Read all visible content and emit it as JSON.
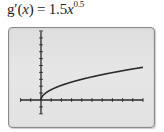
{
  "formula": {
    "lhs": "g′(",
    "var": "x",
    "mid": ") = 1.5",
    "base": "x",
    "exponent": "0.5"
  },
  "chart_data": {
    "type": "line",
    "xlabel": "",
    "ylabel": "",
    "xlim": [
      -2,
      10
    ],
    "ylim": [
      -2,
      10
    ],
    "x_tick_step": 1,
    "y_tick_step": 1,
    "grid": false,
    "legend": null,
    "series": [
      {
        "name": "g'(x) = 1.5x^0.5",
        "x": [
          0,
          0.1,
          0.25,
          0.5,
          1,
          2,
          3,
          4,
          5,
          6,
          7,
          8,
          9,
          10
        ],
        "y": [
          0,
          0.474,
          0.75,
          1.061,
          1.5,
          2.121,
          2.598,
          3.0,
          3.354,
          3.674,
          3.969,
          4.243,
          4.5,
          4.743
        ]
      }
    ],
    "colors": {
      "curve": "#2a2a2a",
      "axes": "#2a2a2a",
      "screen_bg": "#e2e2e2",
      "frame": "#8a8a8a"
    }
  }
}
